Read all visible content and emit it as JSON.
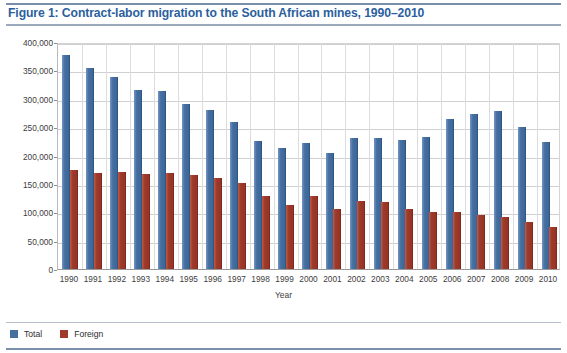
{
  "figure": {
    "title": "Figure 1:  Contract-labor migration to the South African mines, 1990–2010",
    "title_color": "#2b5f9e"
  },
  "legend": {
    "position": "bottom-left",
    "items": [
      {
        "label": "Total",
        "color": "#44709f",
        "swatch_name": "legend-swatch-total"
      },
      {
        "label": "Foreign",
        "color": "#9d3a2a",
        "swatch_name": "legend-swatch-foreign"
      }
    ]
  },
  "chart_data": {
    "type": "bar",
    "title": "Contract-labor migration to the South African mines, 1990–2010",
    "xlabel": "Year",
    "ylabel": "Number",
    "ylim": [
      0,
      400000
    ],
    "ytick_step": 50000,
    "ytick_labels": [
      "0",
      "50,000",
      "100,000",
      "150,000",
      "200,000",
      "250,000",
      "300,000",
      "350,000",
      "400,000"
    ],
    "ytick_values": [
      0,
      50000,
      100000,
      150000,
      200000,
      250000,
      300000,
      350000,
      400000
    ],
    "grid": true,
    "legend_position": "bottom-left",
    "categories": [
      "1990",
      "1991",
      "1992",
      "1993",
      "1994",
      "1995",
      "1996",
      "1997",
      "1998",
      "1999",
      "2000",
      "2001",
      "2002",
      "2003",
      "2004",
      "2005",
      "2006",
      "2007",
      "2008",
      "2009",
      "2010"
    ],
    "series": [
      {
        "name": "Total",
        "color": "#44709f",
        "values": [
          378000,
          354000,
          339000,
          316000,
          313000,
          290000,
          281000,
          259000,
          225000,
          214000,
          222000,
          205000,
          231000,
          230000,
          228000,
          232000,
          265000,
          273000,
          279000,
          251000,
          224000
        ]
      },
      {
        "name": "Foreign",
        "color": "#9d3a2a",
        "values": [
          175000,
          170000,
          171000,
          167000,
          170000,
          166000,
          161000,
          152000,
          128000,
          113000,
          128000,
          106000,
          120000,
          118000,
          105000,
          100000,
          100000,
          95000,
          91000,
          82000,
          74000
        ]
      }
    ]
  }
}
